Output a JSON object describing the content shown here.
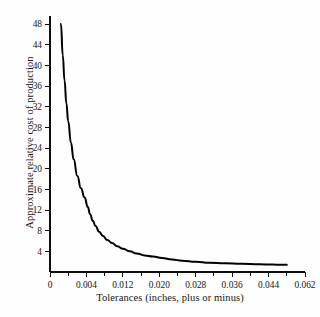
{
  "chart_data": {
    "type": "line",
    "title": "",
    "xlabel": "Tolerances (inches, plus or minus)",
    "ylabel": "Approximate relative cost of production",
    "grid": false,
    "legend": false,
    "xlim": [
      0,
      0.062
    ],
    "ylim": [
      0,
      50
    ],
    "xticks": [
      0,
      0.004,
      0.012,
      0.02,
      0.028,
      0.036,
      0.044,
      0.062
    ],
    "xtick_labels": [
      "0",
      "0.004",
      "0.012",
      "0.020",
      "0.028",
      "0.036",
      "0.044",
      "0.062"
    ],
    "yticks": [
      4,
      8,
      12,
      16,
      20,
      24,
      28,
      32,
      36,
      40,
      44,
      48
    ],
    "ytick_labels": [
      "4",
      "8",
      "12",
      "16",
      "20",
      "24",
      "28",
      "32",
      "36",
      "40",
      "44",
      "48"
    ],
    "series": [
      {
        "name": "Approximate relative cost of production",
        "color": "#000000",
        "x": [
          0.0012,
          0.0014,
          0.0016,
          0.0018,
          0.002,
          0.0023,
          0.0026,
          0.003,
          0.0034,
          0.0038,
          0.0043,
          0.0048,
          0.0054,
          0.006,
          0.0068,
          0.0076,
          0.0086,
          0.0096,
          0.0108,
          0.012,
          0.0135,
          0.015,
          0.0168,
          0.0186,
          0.0206,
          0.0228,
          0.025,
          0.028,
          0.031,
          0.0345,
          0.038,
          0.042,
          0.046,
          0.05,
          0.053
        ],
        "y": [
          48.0,
          42.0,
          37.0,
          32.6,
          29.2,
          25.0,
          21.8,
          18.6,
          16.2,
          14.4,
          12.6,
          11.2,
          9.9,
          8.9,
          7.8,
          7.0,
          6.2,
          5.6,
          5.0,
          4.5,
          4.0,
          3.6,
          3.2,
          3.0,
          2.7,
          2.4,
          2.2,
          2.0,
          1.8,
          1.7,
          1.6,
          1.5,
          1.45,
          1.4,
          1.4
        ]
      }
    ]
  },
  "axis_titles": {
    "y": "Approximate relative cost of production",
    "x": "Tolerances (inches, plus or minus)"
  }
}
